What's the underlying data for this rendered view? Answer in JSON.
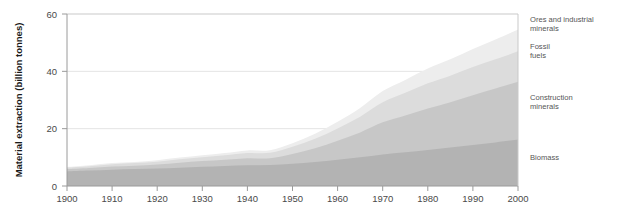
{
  "chart_data": {
    "type": "area",
    "stacked": true,
    "title": "",
    "subtitle": "",
    "xlabel": "",
    "ylabel": "Material extraction (billion tonnes)",
    "xlim": [
      1900,
      2000
    ],
    "ylim": [
      0,
      60
    ],
    "xticks": [
      1900,
      1910,
      1920,
      1930,
      1940,
      1950,
      1960,
      1970,
      1980,
      1990,
      2000
    ],
    "xtick_labels": [
      "1900",
      "1910",
      "1920",
      "1930",
      "1940",
      "1950",
      "1960",
      "1970",
      "1980",
      "1990",
      "2000"
    ],
    "yticks": [
      0,
      20,
      40,
      60
    ],
    "ytick_labels": [
      "0",
      "20",
      "40",
      "60"
    ],
    "grid": true,
    "grid_axis": "y",
    "legend_position": "right-inline-labels",
    "x": [
      1900,
      1905,
      1910,
      1915,
      1920,
      1925,
      1930,
      1935,
      1940,
      1945,
      1950,
      1955,
      1960,
      1965,
      1970,
      1975,
      1980,
      1985,
      1990,
      1995,
      2000
    ],
    "series": [
      {
        "name": "Biomass",
        "label": "Biomass",
        "color": "#b3b3b3",
        "order": 1,
        "values": [
          5.1,
          5.4,
          5.7,
          5.9,
          6.1,
          6.4,
          6.7,
          7.0,
          7.2,
          7.3,
          7.8,
          8.4,
          9.2,
          10.0,
          11.0,
          11.8,
          12.6,
          13.4,
          14.3,
          15.2,
          16.2
        ]
      },
      {
        "name": "Construction minerals",
        "label": "Construction minerals",
        "color": "#c7c7c7",
        "order": 2,
        "values": [
          0.8,
          0.9,
          1.1,
          1.2,
          1.4,
          1.7,
          2.0,
          2.2,
          2.5,
          2.4,
          3.4,
          4.8,
          6.6,
          8.7,
          11.2,
          12.8,
          14.4,
          15.8,
          17.4,
          18.8,
          20.2
        ]
      },
      {
        "name": "Fossil fuels",
        "label": "Fossil fuels",
        "color": "#dcdcdc",
        "order": 3,
        "values": [
          0.5,
          0.6,
          0.8,
          0.9,
          1.0,
          1.2,
          1.3,
          1.5,
          1.8,
          1.9,
          2.5,
          3.3,
          4.3,
          5.5,
          7.0,
          7.9,
          8.8,
          9.3,
          9.8,
          10.2,
          10.6
        ]
      },
      {
        "name": "Ores and industrial minerals",
        "label": "Ores and industrial minerals",
        "color": "#ededed",
        "order": 4,
        "values": [
          0.2,
          0.3,
          0.4,
          0.4,
          0.5,
          0.6,
          0.7,
          0.8,
          0.9,
          0.9,
          1.2,
          1.7,
          2.3,
          3.0,
          3.9,
          4.5,
          5.2,
          5.7,
          6.3,
          6.9,
          7.6
        ]
      }
    ],
    "totals": [
      6.6,
      7.2,
      8.0,
      8.4,
      9.0,
      9.9,
      10.7,
      11.5,
      12.4,
      12.5,
      14.9,
      18.2,
      22.4,
      27.2,
      33.1,
      37.0,
      41.0,
      44.2,
      47.8,
      51.1,
      54.6
    ],
    "annotations": [
      {
        "name": "ores-and-industrial-minerals-label",
        "text_line1": "Ores and industrial",
        "text_line2": "minerals"
      },
      {
        "name": "fossil-fuels-label",
        "text_line1": "Fossil",
        "text_line2": "fuels"
      },
      {
        "name": "construction-minerals-label",
        "text_line1": "Construction",
        "text_line2": "minerals"
      },
      {
        "name": "biomass-label",
        "text_line1": "Biomass",
        "text_line2": ""
      }
    ],
    "colors": {
      "background": "#ffffff",
      "plot_background": "#ffffff",
      "axis": "#9a9a9a",
      "grid": "#e2e2e2",
      "tick_text": "#4a4a4a",
      "axis_title": "#1a1a1a",
      "annotation_text": "#555555"
    }
  },
  "axis": {
    "y_title": "Material extraction (billion tonnes)",
    "y_ticks": [
      "0",
      "20",
      "40",
      "60"
    ],
    "x_ticks": [
      "1900",
      "1910",
      "1920",
      "1930",
      "1940",
      "1950",
      "1960",
      "1970",
      "1980",
      "1990",
      "2000"
    ]
  },
  "labels": {
    "ores_line1": "Ores and industrial",
    "ores_line2": "minerals",
    "fossil_line1": "Fossil",
    "fossil_line2": "fuels",
    "construction_line1": "Construction",
    "construction_line2": "minerals",
    "biomass": "Biomass"
  }
}
